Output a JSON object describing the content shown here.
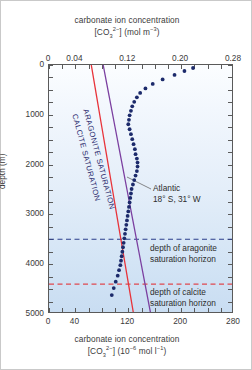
{
  "axes": {
    "top": {
      "caption_line1": "carbonate ion concentration",
      "caption_line2_prefix": "[CO",
      "caption_line2_sub": "3",
      "caption_line2_sup": "2−",
      "caption_line2_mid": "] (mol m",
      "caption_line2_sup2": "−3",
      "caption_line2_suffix": ")",
      "ticks": [
        "0",
        "0.04",
        "0.12",
        "0.20",
        "0.28"
      ],
      "range": [
        0,
        0.28
      ]
    },
    "bottom": {
      "caption_line1": "carbonate ion concentration",
      "caption_line2_prefix": "[CO",
      "caption_line2_sub": "3",
      "caption_line2_sup": "2−",
      "caption_line2_mid": "] (10",
      "caption_line2_sup2": "−6",
      "caption_line2_mid2": " mol l",
      "caption_line2_sup3": "−1",
      "caption_line2_suffix": ")",
      "ticks": [
        "0",
        "40",
        "120",
        "200",
        "280"
      ],
      "range": [
        0,
        280
      ]
    },
    "left": {
      "title": "depth (m)",
      "ticks": [
        "0",
        "1000",
        "2000",
        "3000",
        "4000",
        "5000"
      ],
      "range": [
        0,
        5000
      ]
    }
  },
  "annotations": {
    "aragonite_saturation": "ARAGONITE SATURATION",
    "calcite_saturation": "CALCITE SATURATION",
    "atlantic_line1": "Atlantic",
    "atlantic_line2": "18° S, 31° W",
    "aragonite_horizon_line1": "depth of aragonite",
    "aragonite_horizon_line2": "saturation horizon",
    "calcite_horizon_line1": "depth of calcite",
    "calcite_horizon_line2": "saturation horizon"
  },
  "colors": {
    "calcite_line": "#e8333a",
    "aragonite_line": "#7b3fa0",
    "data_points": "#1c2a6b",
    "aragonite_horizon_dash": "#2b3f8c",
    "calcite_horizon_dash": "#e0484f",
    "frame": "#5a5a5a",
    "plot_background_top": "#fbfdff",
    "plot_background_bottom": "#c9ddf2"
  },
  "chart_data": {
    "type": "scatter",
    "xlabel": "carbonate ion concentration [CO3 2-] (10^-6 mol l^-1)",
    "ylabel": "depth (m)",
    "xlim": [
      0,
      280
    ],
    "ylim": [
      5000,
      0
    ],
    "xlim_top": [
      0,
      0.28
    ],
    "grid": false,
    "legend": "none",
    "series": [
      {
        "name": "Atlantic 18° S, 31° W",
        "marker": "filled circle",
        "color": "#1c2a6b",
        "x": [
          218,
          205,
          190,
          172,
          157,
          146,
          138,
          133,
          129,
          126,
          124,
          122,
          121,
          120,
          122,
          124,
          126,
          128,
          130,
          131,
          133,
          134,
          134,
          133,
          131,
          129,
          127,
          125,
          124,
          123,
          122,
          121,
          120,
          119,
          118,
          117,
          116,
          115,
          114,
          113,
          112,
          111,
          110,
          109,
          108,
          106,
          104,
          101,
          98,
          95
        ],
        "y": [
          60,
          120,
          200,
          290,
          380,
          470,
          560,
          650,
          740,
          830,
          920,
          1010,
          1100,
          1190,
          1290,
          1390,
          1490,
          1590,
          1690,
          1790,
          1880,
          1960,
          2040,
          2130,
          2220,
          2310,
          2400,
          2490,
          2580,
          2670,
          2760,
          2850,
          2940,
          3030,
          3120,
          3210,
          3300,
          3390,
          3480,
          3570,
          3660,
          3750,
          3840,
          3930,
          4020,
          4120,
          4230,
          4350,
          4480,
          4620
        ]
      },
      {
        "name": "CALCITE SATURATION",
        "type": "line",
        "color": "#e8333a",
        "x": [
          64,
          72,
          80,
          88,
          96,
          104,
          112,
          120,
          128
        ],
        "y": [
          0,
          625,
          1250,
          1875,
          2500,
          3125,
          3750,
          4375,
          5000
        ]
      },
      {
        "name": "ARAGONITE SATURATION",
        "type": "line",
        "color": "#7b3fa0",
        "x": [
          82,
          91,
          100,
          109,
          118,
          127,
          136,
          145,
          154
        ],
        "y": [
          0,
          625,
          1250,
          1875,
          2500,
          3125,
          3750,
          4375,
          5000
        ]
      }
    ],
    "horizontal_markers": [
      {
        "name": "depth of aragonite saturation horizon",
        "depth": 3500,
        "color": "#2b3f8c",
        "style": "dashed"
      },
      {
        "name": "depth of calcite saturation horizon",
        "depth": 4400,
        "color": "#e0484f",
        "style": "dashed"
      }
    ]
  }
}
